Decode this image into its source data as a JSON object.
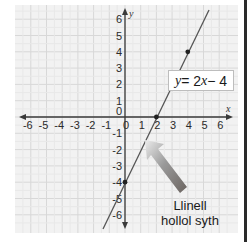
{
  "chart_data": {
    "type": "line",
    "title": "",
    "xlabel": "x",
    "ylabel": "y",
    "xlim": [
      -6,
      6
    ],
    "ylim": [
      -6,
      6
    ],
    "grid": true,
    "x_ticks": [
      "-6",
      "-5",
      "-4",
      "-3",
      "-2",
      "-1",
      "0",
      "1",
      "2",
      "3",
      "4",
      "5",
      "6"
    ],
    "y_ticks": [
      "6",
      "5",
      "4",
      "3",
      "2",
      "1",
      "0",
      "-1",
      "-2",
      "-3",
      "-4",
      "-5",
      "-6"
    ],
    "series": [
      {
        "name": "y = 2x - 4",
        "equation": "y = 2x - 4",
        "slope": 2,
        "intercept": -4,
        "marked_points": [
          {
            "x": 0,
            "y": -4
          },
          {
            "x": 2,
            "y": 0
          },
          {
            "x": 4,
            "y": 4
          }
        ]
      }
    ],
    "annotations": [
      {
        "type": "label",
        "text": "y = 2x − 4",
        "position": "right of line near (4,2)"
      },
      {
        "type": "arrow",
        "text": "Llinell hollol syth",
        "points_to": "the line near (1.3,-1.5)"
      }
    ]
  },
  "equation_label": {
    "y": "y",
    "eq": " = 2",
    "x": "x",
    "rest": " − 4"
  },
  "callout": {
    "line1": "Llinell",
    "line2": "hollol syth"
  },
  "axes": {
    "x_name": "x",
    "y_name": "y"
  },
  "colors": {
    "background": "#f2f2f2",
    "grid": "#dcdcdc",
    "axis": "#3a3a3a",
    "line": "#555555",
    "point": "#222222",
    "arrow_tip": "#e6e6e6",
    "arrow_tail": "#6b6460"
  }
}
